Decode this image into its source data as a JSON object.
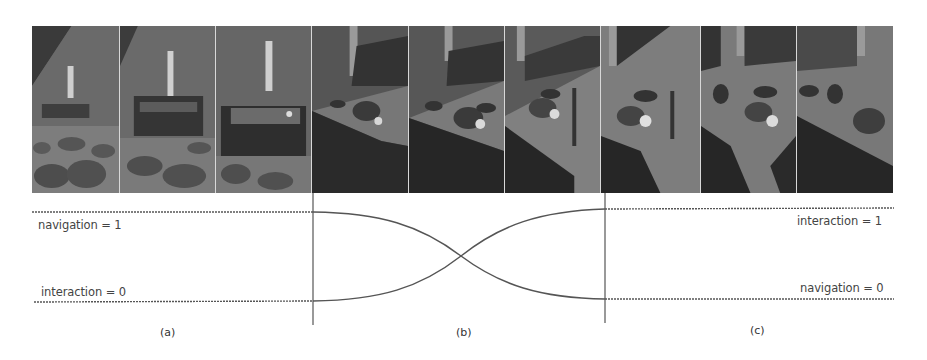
{
  "frames": [
    {
      "id": "f1",
      "x": 0,
      "w": 88,
      "scene": "navigation-far"
    },
    {
      "id": "f2",
      "x": 88,
      "w": 96,
      "scene": "navigation-mid"
    },
    {
      "id": "f3",
      "x": 184,
      "w": 96,
      "scene": "navigation-near"
    },
    {
      "id": "f4",
      "x": 280,
      "w": 97,
      "scene": "transition-1"
    },
    {
      "id": "f5",
      "x": 377,
      "w": 96,
      "scene": "transition-2"
    },
    {
      "id": "f6",
      "x": 473,
      "w": 96,
      "scene": "transition-3"
    },
    {
      "id": "f7",
      "x": 569,
      "w": 100,
      "scene": "interaction-1"
    },
    {
      "id": "f8",
      "x": 669,
      "w": 96,
      "scene": "interaction-2"
    },
    {
      "id": "f9",
      "x": 765,
      "w": 96,
      "scene": "interaction-3"
    }
  ],
  "labels": {
    "left_top": "navigation = 1",
    "left_bottom": "interaction = 0",
    "right_top": "interaction = 1",
    "right_bottom": "navigation = 0"
  },
  "phases": {
    "a": "(a)",
    "b": "(b)",
    "c": "(c)"
  },
  "colors": {
    "line": "#555555",
    "text": "#444444"
  }
}
